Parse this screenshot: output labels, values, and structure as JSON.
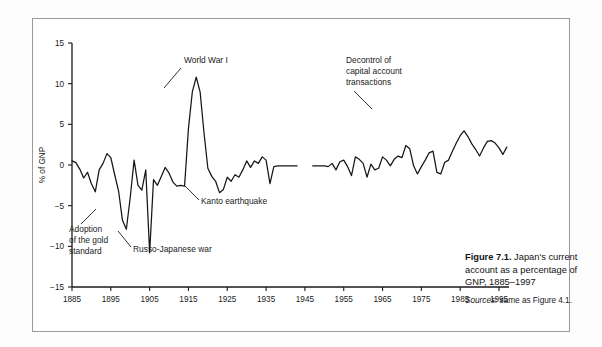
{
  "figure": {
    "caption_label": "Figure 7.1.",
    "caption_text": "Japan's current account as a percentage of GNP, 1885–1997",
    "sources_label": "Sources:",
    "sources_text": "same as Figure 4.1."
  },
  "chart_data": {
    "type": "line",
    "title": "",
    "xlabel": "",
    "ylabel": "% of GNP",
    "xlim": [
      1885,
      1997
    ],
    "ylim": [
      -15,
      15
    ],
    "grid": false,
    "legend": "none",
    "xticks": [
      1885,
      1895,
      1905,
      1915,
      1925,
      1935,
      1945,
      1955,
      1965,
      1975,
      1985,
      1995
    ],
    "yticks": [
      15,
      10,
      5,
      0,
      -5,
      -10,
      -15
    ],
    "ytick_labels": [
      "15",
      "10",
      "5",
      "0",
      "−5",
      "−10",
      "−15"
    ],
    "series": [
      {
        "name": "Japan current account (% of GNP)",
        "x": [
          1885,
          1886,
          1887,
          1888,
          1889,
          1890,
          1891,
          1892,
          1893,
          1894,
          1895,
          1896,
          1897,
          1898,
          1899,
          1900,
          1901,
          1902,
          1903,
          1904,
          1905,
          1906,
          1907,
          1908,
          1909,
          1910,
          1911,
          1912,
          1913,
          1914,
          1915,
          1916,
          1917,
          1918,
          1919,
          1920,
          1921,
          1922,
          1923,
          1924,
          1925,
          1926,
          1927,
          1928,
          1929,
          1930,
          1931,
          1932,
          1933,
          1934,
          1935,
          1936,
          1937,
          1938,
          1939,
          1940,
          1941,
          1942,
          1943
        ],
        "values": [
          0.5,
          0.3,
          -0.5,
          -1.6,
          -0.9,
          -2.3,
          -3.3,
          -0.6,
          0.2,
          1.4,
          0.9,
          -1.2,
          -3.2,
          -6.8,
          -7.9,
          -4.0,
          0.6,
          -2.5,
          -3.1,
          -0.6,
          -10.8,
          -1.8,
          -2.5,
          -1.4,
          -0.3,
          -1.0,
          -2.1,
          -2.6,
          -2.5,
          -2.6,
          4.5,
          9.0,
          10.8,
          9.0,
          4.0,
          -0.4,
          -1.4,
          -2.0,
          -3.4,
          -3.0,
          -1.5,
          -2.0,
          -1.2,
          -1.5,
          -0.6,
          0.5,
          -0.3,
          0.5,
          0.2,
          1.0,
          0.6,
          -2.3,
          -0.2,
          -0.1,
          -0.1,
          -0.1,
          -0.1,
          -0.1,
          -0.1
        ]
      },
      {
        "name": "Japan current account (% of GNP), postwar",
        "x": [
          1947,
          1948,
          1949,
          1950,
          1951,
          1952,
          1953,
          1954,
          1955,
          1956,
          1957,
          1958,
          1959,
          1960,
          1961,
          1962,
          1963,
          1964,
          1965,
          1966,
          1967,
          1968,
          1969,
          1970,
          1971,
          1972,
          1973,
          1974,
          1975,
          1976,
          1977,
          1978,
          1979,
          1980,
          1981,
          1982,
          1983,
          1984,
          1985,
          1986,
          1987,
          1988,
          1989,
          1990,
          1991,
          1992,
          1993,
          1994,
          1995,
          1996,
          1997
        ],
        "values": [
          -0.1,
          -0.1,
          -0.1,
          -0.1,
          -0.2,
          0.2,
          -0.6,
          0.4,
          0.6,
          -0.2,
          -1.3,
          1.0,
          0.7,
          0.2,
          -1.5,
          0.1,
          -0.6,
          -0.4,
          1.0,
          0.6,
          -0.1,
          0.7,
          1.1,
          0.9,
          2.4,
          2.0,
          -0.1,
          -1.1,
          -0.2,
          0.6,
          1.5,
          1.7,
          -0.9,
          -1.1,
          0.3,
          0.6,
          1.7,
          2.7,
          3.6,
          4.2,
          3.5,
          2.6,
          1.9,
          1.1,
          2.1,
          2.9,
          3.0,
          2.7,
          2.1,
          1.3,
          2.2
        ]
      }
    ],
    "annotations": [
      {
        "id": "world-war-i",
        "text": "World War I",
        "target_x": 1917,
        "target_y": 10.6
      },
      {
        "id": "adoption-gold-standard",
        "line1": "Adoption",
        "line2": "of the gold",
        "line3": "standard",
        "target_x": 1899,
        "target_y": -7.8
      },
      {
        "id": "russo-japanese-war",
        "text": "Russo-Japanese war",
        "target_x": 1905,
        "target_y": -10.6
      },
      {
        "id": "kanto-earthquake",
        "text": "Kanto earthquake",
        "target_x": 1923,
        "target_y": -3.4
      },
      {
        "id": "decontrol-capital-account",
        "line1": "Decontrol of",
        "line2": "capital account",
        "line3": "transactions",
        "target_x": 1985,
        "target_y": 3.7
      }
    ]
  }
}
